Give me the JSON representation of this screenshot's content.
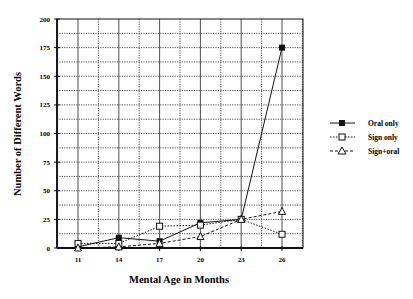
{
  "chart_data": {
    "type": "line",
    "title": "",
    "xlabel": "Mental Age in Months",
    "ylabel": "Number of Different Words",
    "x": [
      11,
      14,
      17,
      20,
      23,
      26
    ],
    "x_tick_labels": [
      "11",
      "14",
      "17",
      "20",
      "23",
      "26"
    ],
    "y_ticks": [
      0,
      25,
      50,
      75,
      100,
      125,
      150,
      175,
      200
    ],
    "y_tick_labels": [
      "0",
      "25",
      "50",
      "75",
      "100",
      "125",
      "150",
      "175",
      "200"
    ],
    "ylim": [
      0,
      200
    ],
    "xlim": [
      9.5,
      28.5
    ],
    "grid": true,
    "legend_position": "right",
    "series": [
      {
        "name": "Oral only",
        "marker": "filled-square",
        "line": "solid",
        "values": [
          1,
          9,
          6,
          22,
          25,
          175
        ]
      },
      {
        "name": "Sign only",
        "marker": "open-square",
        "line": "dotted",
        "values": [
          4,
          4,
          19,
          20,
          25,
          12
        ]
      },
      {
        "name": "Sign+oral",
        "marker": "open-triangle",
        "line": "dashed",
        "values": [
          0,
          1,
          4,
          10,
          25,
          32
        ]
      }
    ]
  },
  "legend": {
    "items": [
      {
        "label": "Oral only"
      },
      {
        "label": "Sign only"
      },
      {
        "label": "Sign+oral"
      }
    ]
  }
}
